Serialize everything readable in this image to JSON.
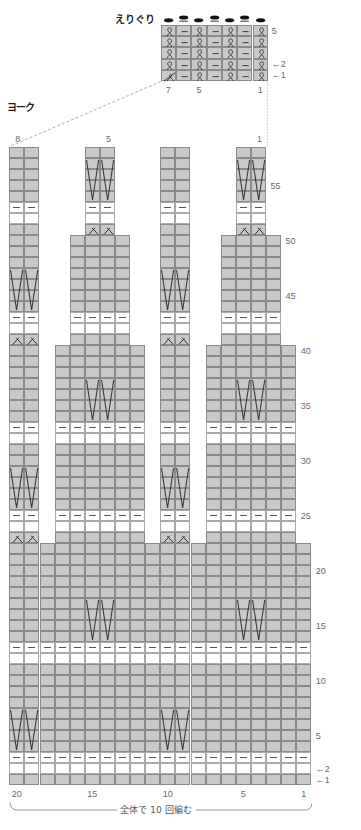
{
  "neckline": {
    "title": "えりぐり",
    "chart": {
      "columns": 7,
      "rows": 5,
      "rows_top_to_bottom": [
        "tptptpt",
        "tptptpt",
        "tptptpt",
        "tptptpt",
        "zptptpt"
      ],
      "bind_off": "kpkpkpk"
    },
    "row_labels": [
      {
        "row": 5,
        "text": "5"
      },
      {
        "row": 2,
        "text": "←2"
      },
      {
        "row": 1,
        "text": "←1"
      }
    ],
    "column_labels": [
      {
        "col": 7,
        "text": "7"
      },
      {
        "col": 5,
        "text": "5"
      },
      {
        "col": 1,
        "text": "1"
      }
    ]
  },
  "yoke": {
    "title": "ヨーク",
    "chart": {
      "columns": 20,
      "rows": 58,
      "rows_bottom_to_top": [
        "gggggggggggggggggggg",
        "bbbbbbbbbbbbbbbbbbbb",
        "pppppppppppppppppppp",
        "gggggggggggggggggggg",
        "gggggggggggggggggggg",
        "gggggggggggggggggggg",
        "gggggggggggggggggggg",
        "gggggggggggggggggggg",
        "gggggggggggggggggggg",
        "gggggggggggggggggggg",
        "gggggggggggggggggggg",
        "bbbbbbbbbbbbbbbbbbbb",
        "pppppppppppppppppppp",
        "gggggggggggggggggggg",
        "gggggggggggggggggggg",
        "gggggggggggggggggggg",
        "gggggggggggggggggggg",
        "gggggggggggggggggggg",
        "gggggggggggggggggggg",
        "gggggggggggggggggggg",
        "gggggggggggggggggggg",
        "gggggggggggggggggggg",
        "dd.gggggg.dd.gggggg.",
        "bb.bbbbbb.bb.bbbbbb.",
        "pp.pppppp.pp.pppppp.",
        "gg.gggggg.gg.gggggg.",
        "gg.gggggg.gg.gggggg.",
        "gg.gggggg.gg.gggggg.",
        "gg.gggggg.gg.gggggg.",
        "gg.gggggg.gg.gggggg.",
        "gg.gggggg.gg.gggggg.",
        "bb.bbbbbb.bb.bbbbbb.",
        "pp.pppppp.pp.pppppp.",
        "gg.gggggg.gg.gggggg.",
        "gg.gggggg.gg.gggggg.",
        "gg.gggggg.gg.gggggg.",
        "gg.gggggg.gg.gggggg.",
        "gg.gggggg.gg.gggggg.",
        "gg.gggggg.gg.gggggg.",
        "gg.gggggg.gg.gggggg.",
        "dd..gggg..dd..gggg..",
        "bb..bbbb..bb..bbbb..",
        "pp..pppp..pp..pppp..",
        "gg..gggg..gg..gggg..",
        "gg..gggg..gg..gggg..",
        "gg..gggg..gg..gggg..",
        "gg..gggg..gg..gggg..",
        "gg..gggg..gg..gggg..",
        "gg..gggg..gg..gggg..",
        "gg..gggg..gg..gggg..",
        "gg...dd...gg...dd...",
        "bb...bb...bb...bb...",
        "pp...pp...pp...pp...",
        "gg...gg...gg...gg...",
        "gg...gg...gg...gg...",
        "gg...gg...gg...gg...",
        "gg...gg...gg...gg...",
        "gg...gg...gg...gg..."
      ],
      "long_v_symbols": [
        {
          "cols": [
            20,
            19
          ],
          "rows": [
            4,
            7
          ]
        },
        {
          "cols": [
            10,
            9
          ],
          "rows": [
            4,
            7
          ]
        },
        {
          "cols": [
            15,
            14
          ],
          "rows": [
            14,
            17
          ]
        },
        {
          "cols": [
            5,
            4
          ],
          "rows": [
            14,
            17
          ]
        },
        {
          "cols": [
            20,
            19
          ],
          "rows": [
            26,
            29
          ]
        },
        {
          "cols": [
            10,
            9
          ],
          "rows": [
            26,
            29
          ]
        },
        {
          "cols": [
            15,
            14
          ],
          "rows": [
            34,
            37
          ]
        },
        {
          "cols": [
            5,
            4
          ],
          "rows": [
            34,
            37
          ]
        },
        {
          "cols": [
            20,
            19
          ],
          "rows": [
            44,
            47
          ]
        },
        {
          "cols": [
            10,
            9
          ],
          "rows": [
            44,
            47
          ]
        },
        {
          "cols": [
            15,
            14
          ],
          "rows": [
            54,
            57
          ]
        },
        {
          "cols": [
            5,
            4
          ],
          "rows": [
            54,
            57
          ]
        }
      ]
    },
    "top_labels": [
      {
        "col": 20,
        "text": "8"
      },
      {
        "col": 14,
        "text": "5"
      },
      {
        "col": 4,
        "text": "1"
      }
    ],
    "row_labels": [
      {
        "row": 55,
        "text": "55"
      },
      {
        "row": 50,
        "text": "50"
      },
      {
        "row": 45,
        "text": "45"
      },
      {
        "row": 40,
        "text": "40"
      },
      {
        "row": 35,
        "text": "35"
      },
      {
        "row": 30,
        "text": "30"
      },
      {
        "row": 25,
        "text": "25"
      },
      {
        "row": 20,
        "text": "20"
      },
      {
        "row": 15,
        "text": "15"
      },
      {
        "row": 10,
        "text": "10"
      },
      {
        "row": 5,
        "text": "5"
      },
      {
        "row": 2,
        "text": "←2"
      },
      {
        "row": 1,
        "text": "←1"
      }
    ],
    "column_labels": [
      {
        "col": 20,
        "text": "20"
      },
      {
        "col": 15,
        "text": "15"
      },
      {
        "col": 10,
        "text": "10"
      },
      {
        "col": 5,
        "text": "5"
      },
      {
        "col": 1,
        "text": "1"
      }
    ],
    "repeat_note": "全体で 10 回編む"
  },
  "colors": {
    "shaded_cell": "#c9c9c9",
    "grid_line": "#8a8a8a",
    "symbol_ink": "#333333",
    "label_text": "#6a6a6a"
  }
}
